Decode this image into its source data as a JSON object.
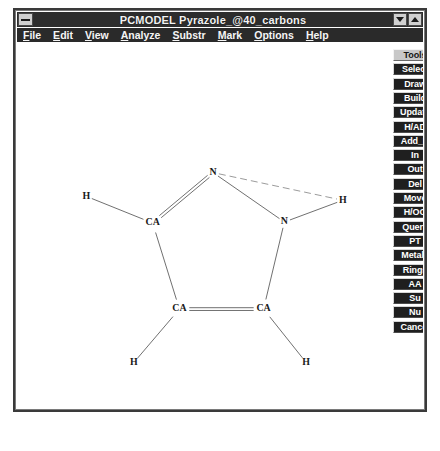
{
  "window": {
    "title": "PCMODEL    Pyrazole_@40_carbons",
    "sysmenu_icon": "system-menu-icon",
    "minimize_icon": "minimize-arrow-icon",
    "maximize_icon": "maximize-arrow-icon"
  },
  "menubar": {
    "items": [
      {
        "label": "File",
        "accel": "F"
      },
      {
        "label": "Edit",
        "accel": "E"
      },
      {
        "label": "View",
        "accel": "V"
      },
      {
        "label": "Analyze",
        "accel": "A"
      },
      {
        "label": "Substr",
        "accel": "S"
      },
      {
        "label": "Mark",
        "accel": "M"
      },
      {
        "label": "Options",
        "accel": "O"
      },
      {
        "label": "Help",
        "accel": "H"
      }
    ]
  },
  "toolbar": {
    "buttons": [
      {
        "label": "Tools",
        "style": "light"
      },
      {
        "label": "Select",
        "style": "dark"
      },
      {
        "label": "Draw",
        "style": "dark"
      },
      {
        "label": "Build",
        "style": "dark"
      },
      {
        "label": "Update",
        "style": "dark"
      },
      {
        "label": "H/AD",
        "style": "dark"
      },
      {
        "label": "Add_B",
        "style": "dark"
      },
      {
        "label": "In",
        "style": "dark"
      },
      {
        "label": "Out",
        "style": "dark"
      },
      {
        "label": "Del",
        "style": "dark"
      },
      {
        "label": "Move",
        "style": "dark"
      },
      {
        "label": "H/OO",
        "style": "dark"
      },
      {
        "label": "Query",
        "style": "dark"
      },
      {
        "label": "PT",
        "style": "dark"
      },
      {
        "label": "Metals",
        "style": "dark"
      },
      {
        "label": "Rings",
        "style": "dark"
      },
      {
        "label": "AA",
        "style": "dark"
      },
      {
        "label": "Su",
        "style": "dark"
      },
      {
        "label": "Nu",
        "style": "dark"
      },
      {
        "label": "Cancel",
        "style": "dark"
      }
    ]
  },
  "molecule": {
    "name": "Pyrazole",
    "atoms": [
      {
        "id": "N1",
        "label": "N",
        "x": 198,
        "y": 131
      },
      {
        "id": "N2",
        "label": "N",
        "x": 270,
        "y": 181
      },
      {
        "id": "CA3",
        "label": "CA",
        "x": 137,
        "y": 182
      },
      {
        "id": "CA4",
        "label": "CA",
        "x": 164,
        "y": 269
      },
      {
        "id": "CA5",
        "label": "CA",
        "x": 249,
        "y": 269
      },
      {
        "id": "H6",
        "label": "H",
        "x": 70,
        "y": 155
      },
      {
        "id": "H7",
        "label": "H",
        "x": 329,
        "y": 159
      },
      {
        "id": "H8",
        "label": "H",
        "x": 118,
        "y": 323
      },
      {
        "id": "H9",
        "label": "H",
        "x": 292,
        "y": 323
      }
    ],
    "bonds": [
      {
        "from": "N1",
        "to": "CA3",
        "order": 2,
        "style": "solid"
      },
      {
        "from": "N1",
        "to": "N2",
        "order": 1,
        "style": "solid"
      },
      {
        "from": "N1",
        "to": "H7",
        "order": 1,
        "style": "dashed"
      },
      {
        "from": "N2",
        "to": "CA5",
        "order": 1,
        "style": "solid"
      },
      {
        "from": "N2",
        "to": "H7",
        "order": 1,
        "style": "solid"
      },
      {
        "from": "CA3",
        "to": "CA4",
        "order": 1,
        "style": "solid"
      },
      {
        "from": "CA3",
        "to": "H6",
        "order": 1,
        "style": "solid"
      },
      {
        "from": "CA4",
        "to": "CA5",
        "order": 2,
        "style": "solid"
      },
      {
        "from": "CA4",
        "to": "H8",
        "order": 1,
        "style": "solid"
      },
      {
        "from": "CA5",
        "to": "H9",
        "order": 1,
        "style": "solid"
      }
    ],
    "bond_color": "#6e6e6e",
    "atom_color": "#1a1a1a"
  },
  "caption": {
    "text": ""
  }
}
